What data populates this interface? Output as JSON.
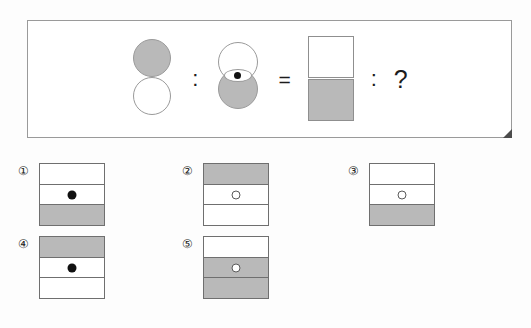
{
  "question": {
    "operators": {
      "ratio_1": ":",
      "equals": "=",
      "ratio_2": ":",
      "unknown": "?"
    },
    "terms": [
      {
        "name": "term-a",
        "description": "gray circle above white circle",
        "shapes": [
          "gray-circle",
          "white-circle"
        ]
      },
      {
        "name": "term-b",
        "description": "white circle overlapping gray circle with filled dot in lens",
        "shapes": [
          "white-circle",
          "gray-circle",
          "filled-dot"
        ]
      },
      {
        "name": "term-c",
        "description": "white square above gray square",
        "shapes": [
          "white-square",
          "gray-square"
        ]
      }
    ]
  },
  "options": [
    {
      "label": "①",
      "cells": [
        {
          "fill": "white",
          "mark": "none"
        },
        {
          "fill": "white",
          "mark": "filled"
        },
        {
          "fill": "gray",
          "mark": "none"
        }
      ]
    },
    {
      "label": "②",
      "cells": [
        {
          "fill": "gray",
          "mark": "none"
        },
        {
          "fill": "white",
          "mark": "hollow"
        },
        {
          "fill": "white",
          "mark": "none"
        }
      ]
    },
    {
      "label": "③",
      "cells": [
        {
          "fill": "white",
          "mark": "none"
        },
        {
          "fill": "white",
          "mark": "hollow"
        },
        {
          "fill": "gray",
          "mark": "none"
        }
      ]
    },
    {
      "label": "④",
      "cells": [
        {
          "fill": "gray",
          "mark": "none"
        },
        {
          "fill": "white",
          "mark": "filled"
        },
        {
          "fill": "white",
          "mark": "none"
        }
      ]
    },
    {
      "label": "⑤",
      "cells": [
        {
          "fill": "white",
          "mark": "none"
        },
        {
          "fill": "gray",
          "mark": "hollow"
        },
        {
          "fill": "gray",
          "mark": "none"
        }
      ]
    }
  ],
  "colors": {
    "gray_fill": "#b9b9b9",
    "white_fill": "#ffffff",
    "outline": "#6f6f6f",
    "dot_filled": "#111111",
    "panel_border": "#9a9a9a",
    "background": "#fdfdfd"
  }
}
